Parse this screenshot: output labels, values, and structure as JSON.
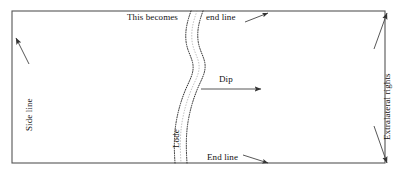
{
  "figure": {
    "background_color": "#ffffff",
    "line_color": "#444444",
    "text_color": "#111111"
  },
  "claim_boundary": {
    "name": "claim-rectangle",
    "left": 12,
    "top": 11,
    "right": 385,
    "bottom": 163
  },
  "labels": {
    "this_becomes": "This becomes",
    "end_line_top": "end line",
    "dip": "Dip",
    "end_line_bottom": "End line",
    "side_line": "Side line",
    "lode": "Lode",
    "extralateral_rights": "Extralateral rights"
  },
  "annotations": [
    {
      "name": "side-line-pointer",
      "label": "Side line",
      "orientation": "vertical-up",
      "arrow": "up-left",
      "target": "left boundary line"
    },
    {
      "name": "end-line-top-pointer",
      "label": "end line",
      "orientation": "horizontal",
      "arrow": "up-right",
      "target": "top boundary line"
    },
    {
      "name": "end-line-bottom-pointer",
      "label": "End line",
      "orientation": "horizontal",
      "arrow": "down-right",
      "target": "bottom boundary line"
    },
    {
      "name": "dip-arrow",
      "label": "Dip",
      "orientation": "horizontal",
      "arrow": "right",
      "target": "direction of lode dip"
    },
    {
      "name": "extralateral-rights-span",
      "label": "Extralateral rights",
      "orientation": "vertical-up",
      "arrow": "double-ended",
      "target": "right boundary, top to bottom"
    },
    {
      "name": "lode-label",
      "label": "Lode",
      "orientation": "vertical-up",
      "arrow": "none",
      "target": "stippled wavy vein band"
    }
  ],
  "lode_band": {
    "name": "lode-vein",
    "style": "stippled double wavy line",
    "top_x": 203,
    "bottom_x": 187,
    "width_px": 13
  }
}
